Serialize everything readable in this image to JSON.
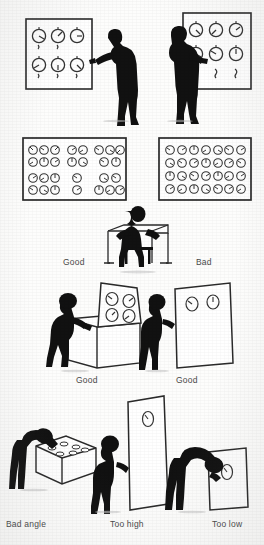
{
  "figure": {
    "title": "Control panel and display placement examples",
    "ink_color": "#111111",
    "panel_stroke": "#2a2a2a",
    "label_color": "#4a4a4a",
    "background": "#fdfdfc"
  },
  "rows": [
    {
      "id": "row-standing-panels",
      "scenes": [
        {
          "id": "scene-panel-left",
          "description": "Standing operator reaching toward a wall panel with six dials",
          "dial_rows": 2,
          "dial_cols": 3,
          "dial_count": 6,
          "has_figure": true,
          "figure_pose": "standing-reaching-right",
          "label": ""
        },
        {
          "id": "scene-panel-right",
          "description": "Standing operator reaching toward a wall panel with six dials and lower switches",
          "dial_rows": 2,
          "dial_cols": 3,
          "dial_count": 6,
          "switch_count": 3,
          "has_figure": true,
          "figure_pose": "standing-reaching-right",
          "label": ""
        }
      ]
    },
    {
      "id": "row-dial-arrays",
      "scenes": [
        {
          "id": "scene-grouped-dials",
          "description": "Panel with dials arranged in functional groups (good grouping)",
          "dial_rows": 4,
          "dial_cols": 8,
          "dial_count": 26,
          "arrangement": "grouped",
          "label": "Good"
        },
        {
          "id": "scene-uniform-dials",
          "description": "Panel with dials arranged in an undifferentiated uniform grid (bad grouping)",
          "dial_rows": 4,
          "dial_cols": 7,
          "dial_count": 28,
          "arrangement": "uniform-grid",
          "label": "Bad"
        }
      ]
    },
    {
      "id": "row-seated-console",
      "scenes": [
        {
          "id": "scene-seated-operator",
          "description": "Operator seated at a desk-height console",
          "has_figure": true,
          "figure_pose": "seated-at-desk",
          "label": ""
        }
      ]
    },
    {
      "id": "row-sloped-consoles",
      "scenes": [
        {
          "id": "scene-sloped-console",
          "description": "Operator standing at a console with a sloped display panel carrying four dials",
          "dial_count": 4,
          "panel_angle": "sloped",
          "has_figure": true,
          "figure_pose": "standing-leaning-forward",
          "label": "Good"
        },
        {
          "id": "scene-vertical-panel",
          "description": "Operator standing beside a tall vertical panel with two dials at eye level",
          "dial_count": 2,
          "panel_angle": "vertical",
          "has_figure": true,
          "figure_pose": "standing-upright",
          "label": "Good"
        }
      ]
    },
    {
      "id": "row-viewing-angles",
      "scenes": [
        {
          "id": "scene-bad-angle",
          "description": "Operator bending over a low horizontal box of dials, viewing at a poor angle",
          "dial_count": 6,
          "has_figure": true,
          "figure_pose": "bending-over",
          "label": "Bad angle"
        },
        {
          "id": "scene-too-high",
          "description": "Operator standing beside a tall panel with a single dial placed above eye level",
          "dial_count": 1,
          "has_figure": true,
          "figure_pose": "standing-upright",
          "label": "Too high"
        },
        {
          "id": "scene-too-low",
          "description": "Operator stooping to read a single dial mounted near the floor",
          "dial_count": 1,
          "has_figure": true,
          "figure_pose": "stooping",
          "label": "Too low"
        }
      ]
    }
  ],
  "labels": {
    "good_1": "Good",
    "bad_1": "Bad",
    "good_2": "Good",
    "good_3": "Good",
    "bad_angle": "Bad angle",
    "too_high": "Too high",
    "too_low": "Too low"
  }
}
